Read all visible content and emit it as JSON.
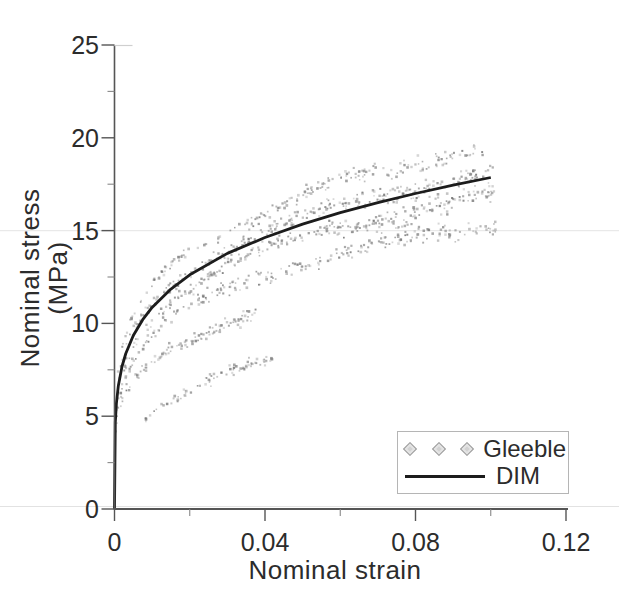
{
  "colors": {
    "background": "#ffffff",
    "axis": "#555555",
    "minor_tick": "#888888",
    "tick_text": "#2c2c2c",
    "curve": "#1c1c1c",
    "scatter": "#8c8c8c",
    "scatter_dark": "#6e6e6e",
    "gridline": "#e9e9e9",
    "scan_artifact": "#e2e2e2",
    "frame_remnant": "#cfcfcf",
    "legend_border": "#b5b5b5",
    "legend_marker_fill": "#d2d2d2",
    "legend_marker_stroke": "#9e9e9e"
  },
  "chart_data": {
    "type": "scatter",
    "title": "",
    "xlabel": "Nominal strain",
    "ylabel": "Nominal stress (MPa)",
    "xlim": [
      0,
      0.12
    ],
    "ylim": [
      0,
      25
    ],
    "grid": "single horizontal gridline at y=15 (faint, spans full image width)",
    "gridlines_y": [
      15
    ],
    "x_ticks": [
      {
        "v": 0,
        "label": "0"
      },
      {
        "v": 0.04,
        "label": "0.04"
      },
      {
        "v": 0.08,
        "label": "0.08"
      },
      {
        "v": 0.12,
        "label": "0.12"
      }
    ],
    "x_minor_ticks": [
      0.02,
      0.06,
      0.1
    ],
    "y_ticks": [
      {
        "v": 0,
        "label": "0"
      },
      {
        "v": 5,
        "label": "5"
      },
      {
        "v": 10,
        "label": "10"
      },
      {
        "v": 15,
        "label": "15"
      },
      {
        "v": 20,
        "label": "20"
      },
      {
        "v": 25,
        "label": "25"
      }
    ],
    "y_minor_ticks": [
      2.5,
      7.5,
      12.5,
      17.5,
      22.5
    ],
    "legend": {
      "position": "bottom-right",
      "entries": [
        {
          "label": "Gleeble",
          "swatch": "three-diamond-markers"
        },
        {
          "label": "DIM",
          "swatch": "solid-line"
        }
      ]
    },
    "series": [
      {
        "name": "Gleeble",
        "type": "scatter",
        "marker": "tiny-dot",
        "color": "#8c8c8c",
        "seed": 13,
        "description": "Dense noisy cloud of ~1200 tiny gray dots from repeated Gleeble tests, banded around the DIM curve; fans out to 15-21 MPa near strain 0.1; sparse low trail below the cloud for strain < 0.045",
        "bands": [
          {
            "factor": 1.1,
            "n": 200,
            "sigma": 0.45,
            "x_range": [
              0.0008,
              0.0985
            ],
            "x_shift": 0,
            "wiggle": [
              0.3,
              120,
              0.8
            ]
          },
          {
            "factor": 1.02,
            "n": 280,
            "sigma": 0.48,
            "x_range": [
              0.0004,
              0.1008
            ],
            "x_shift": 0,
            "wiggle": [
              0.22,
              105,
              2.1
            ]
          },
          {
            "factor": 0.95,
            "n": 280,
            "sigma": 0.48,
            "x_range": [
              0.0004,
              0.101
            ],
            "x_shift": 0,
            "wiggle": [
              0.22,
              92,
              4.0
            ]
          },
          {
            "factor": 0.86,
            "n": 230,
            "sigma": 0.52,
            "x_range": [
              0.0005,
              0.1014
            ],
            "x_shift": 0,
            "wiggle": [
              0.2,
              118,
              5.3
            ]
          },
          {
            "factor": 0.73,
            "n": 110,
            "sigma": 0.5,
            "x_range": [
              0.0002,
              0.038
            ],
            "x_shift": 0,
            "wiggle": [
              0.2,
              140,
              1.5
            ]
          },
          {
            "factor": 0.55,
            "n": 80,
            "sigma": 0.45,
            "x_range": [
              0.008,
              0.042
            ],
            "x_shift": 0.004,
            "wiggle": [
              0.2,
              100,
              3.3
            ]
          }
        ]
      },
      {
        "name": "DIM",
        "type": "line",
        "color": "#1c1c1c",
        "width": 2.8,
        "points": [
          [
            0,
            0
          ],
          [
            0.0002,
            4.67
          ],
          [
            0.0005,
            5.69
          ],
          [
            0.001,
            6.62
          ],
          [
            0.002,
            7.68
          ],
          [
            0.003,
            8.38
          ],
          [
            0.005,
            9.35
          ],
          [
            0.0075,
            10.2
          ],
          [
            0.01,
            10.86
          ],
          [
            0.015,
            11.85
          ],
          [
            0.02,
            12.62
          ],
          [
            0.03,
            13.77
          ],
          [
            0.04,
            14.63
          ],
          [
            0.05,
            15.35
          ],
          [
            0.06,
            15.97
          ],
          [
            0.07,
            16.51
          ],
          [
            0.08,
            17.0
          ],
          [
            0.09,
            17.45
          ],
          [
            0.1,
            17.86
          ]
        ]
      }
    ]
  }
}
